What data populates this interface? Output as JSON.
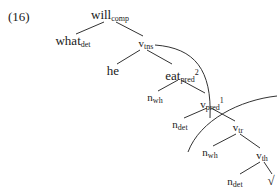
{
  "example_number": "(16)",
  "tree": {
    "nodes": [
      {
        "id": "will",
        "base": "will",
        "sub": "comp",
        "sup": ""
      },
      {
        "id": "what",
        "base": "what",
        "sub": "det",
        "sup": ""
      },
      {
        "id": "vtns",
        "base": "v",
        "sub": "tns",
        "sup": ""
      },
      {
        "id": "he",
        "base": "he",
        "sub": "",
        "sup": ""
      },
      {
        "id": "eat",
        "base": "eat",
        "sub": "pred",
        "sup": "2"
      },
      {
        "id": "nwh1",
        "base": "n",
        "sub": "wh",
        "sup": ""
      },
      {
        "id": "vpred",
        "base": "v",
        "sub": "pred",
        "sup": "1"
      },
      {
        "id": "ndet1",
        "base": "n",
        "sub": "det",
        "sup": ""
      },
      {
        "id": "vtr",
        "base": "v",
        "sub": "tr",
        "sup": ""
      },
      {
        "id": "nwh2",
        "base": "n",
        "sub": "wh",
        "sup": ""
      },
      {
        "id": "vth",
        "base": "v",
        "sub": "th",
        "sup": ""
      },
      {
        "id": "ndet2",
        "base": "n",
        "sub": "det",
        "sup": ""
      },
      {
        "id": "root",
        "base": "√",
        "sub": "",
        "sup": ""
      }
    ],
    "edges": [
      [
        "will",
        "what"
      ],
      [
        "will",
        "vtns"
      ],
      [
        "vtns",
        "he"
      ],
      [
        "vtns",
        "eat"
      ],
      [
        "eat",
        "nwh1"
      ],
      [
        "eat",
        "vpred"
      ],
      [
        "vpred",
        "ndet1"
      ],
      [
        "vpred",
        "vtr"
      ],
      [
        "vtr",
        "nwh2"
      ],
      [
        "vtr",
        "vth"
      ],
      [
        "vth",
        "ndet2"
      ],
      [
        "vth",
        "root"
      ]
    ],
    "arcs": [
      "vtns-to-vpred-boundary",
      "vtr-boundary"
    ]
  }
}
